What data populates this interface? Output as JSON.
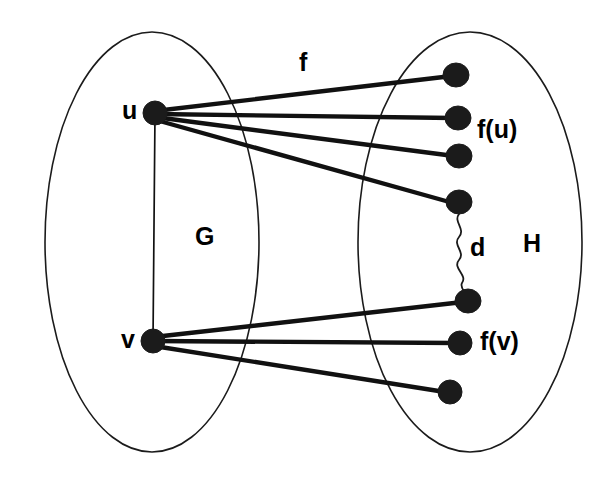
{
  "figure": {
    "background_color": "#ffffff",
    "stroke_color": "#1b1b1b",
    "width": 604,
    "height": 486
  },
  "labels": {
    "source_vertex_u": "u",
    "source_vertex_v": "v",
    "source_set": "G",
    "target_set": "H",
    "mapping": "f",
    "distance": "d",
    "image_of_u": "f(u)",
    "image_of_v": "f(v)"
  },
  "sets": [
    {
      "name": "G",
      "cx": 152,
      "cy": 242,
      "rx": 107,
      "ry": 210
    },
    {
      "name": "H",
      "cx": 470,
      "cy": 242,
      "rx": 112,
      "ry": 210
    }
  ],
  "vertices": {
    "source": [
      {
        "id": "u",
        "cx": 155,
        "cy": 113,
        "r": 11
      },
      {
        "id": "v",
        "cx": 153,
        "cy": 341,
        "r": 11
      }
    ],
    "target": [
      {
        "id": "h1",
        "cx": 456,
        "cy": 75,
        "r": 12
      },
      {
        "id": "h2",
        "cx": 458,
        "cy": 118,
        "r": 12
      },
      {
        "id": "h3",
        "cx": 459,
        "cy": 156,
        "r": 12
      },
      {
        "id": "h4",
        "cx": 459,
        "cy": 202,
        "r": 12
      },
      {
        "id": "h5",
        "cx": 468,
        "cy": 301,
        "r": 12
      },
      {
        "id": "h6",
        "cx": 460,
        "cy": 343,
        "r": 12
      },
      {
        "id": "h7",
        "cx": 450,
        "cy": 392,
        "r": 12
      }
    ]
  },
  "edges": {
    "mapping_from_u": [
      {
        "from": "u",
        "to": "h1"
      },
      {
        "from": "u",
        "to": "h2"
      },
      {
        "from": "u",
        "to": "h3"
      },
      {
        "from": "u",
        "to": "h4"
      }
    ],
    "mapping_from_v": [
      {
        "from": "v",
        "to": "h5"
      },
      {
        "from": "v",
        "to": "h6"
      },
      {
        "from": "v",
        "to": "h7"
      }
    ],
    "source_edge": {
      "from": "u",
      "to": "v"
    },
    "distance_edge": {
      "from": "h4",
      "to": "h5",
      "style": "squiggly"
    }
  }
}
